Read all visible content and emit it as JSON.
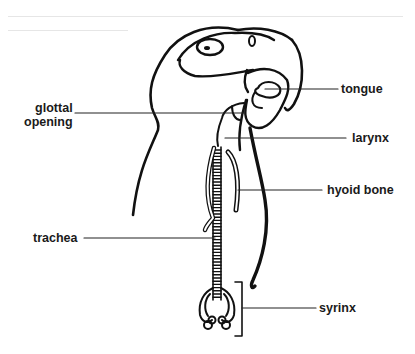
{
  "diagram": {
    "labels": [
      {
        "id": "glottal-opening",
        "line1": "glottal",
        "line2": "opening"
      },
      {
        "id": "tongue",
        "text": "tongue"
      },
      {
        "id": "larynx",
        "text": "larynx"
      },
      {
        "id": "hyoid-bone",
        "text": "hyoid bone"
      },
      {
        "id": "trachea",
        "text": "trachea"
      },
      {
        "id": "syrinx",
        "text": "syrinx"
      }
    ],
    "colors": {
      "ink": "#111111",
      "background": "#ffffff",
      "label": "#1a1a1a"
    }
  }
}
